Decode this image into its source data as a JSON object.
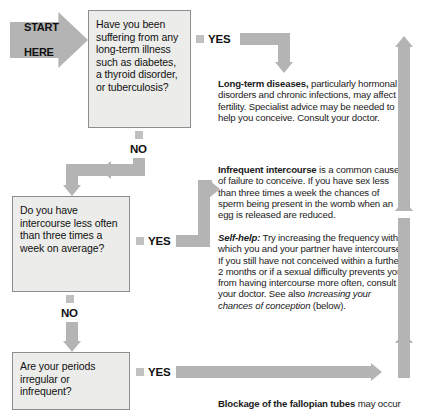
{
  "start": {
    "line1": "START",
    "line2": "HERE"
  },
  "questions": [
    {
      "id": "q-long-term-illness",
      "text": "Have you been suffering from any long-term illness such as diabetes, a thyroid disorder, or tuberculosis?",
      "yes_label": "YES",
      "no_label": "NO"
    },
    {
      "id": "q-intercourse-frequency",
      "text": "Do you have intercourse less often than three times a week on average?",
      "yes_label": "YES",
      "no_label": "NO"
    },
    {
      "id": "q-periods-irregular",
      "text": "Are your periods irregular or infrequent?",
      "yes_label": "YES"
    }
  ],
  "advice": {
    "long_term": {
      "lead": "Long-term diseases,",
      "body": " particularly hormonal disorders and chronic infections, may affect fertility. Specialist advice may be needed to help you conceive. Consult your doctor."
    },
    "infrequent": {
      "lead": "Infrequent intercourse",
      "body": " is a common cause of failure to conceive. If you have sex less than three times a week the chances of sperm being present in the womb when an egg is released are reduced."
    },
    "self_help": {
      "lead": "Self-help:",
      "body_1": " Try increasing the frequency with which you and your partner have intercourse. If you still have not conceived within a further 2 months or if a sexual difficulty prevents you from having intercourse more often, consult your doctor. See also ",
      "cross_ref": "Increasing your chances of conception",
      "body_2": " (below)."
    },
    "blockage": {
      "lead": "Blockage of the fallopian tubes",
      "body": " may occur"
    }
  },
  "colors": {
    "connector": "#b4b4b4",
    "box_fill": "#ececea",
    "box_border": "#8e8e8e",
    "bullet": "#c0c0c0",
    "text": "#111111"
  }
}
